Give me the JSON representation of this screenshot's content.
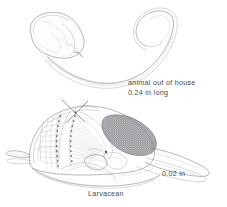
{
  "figure": {
    "title_label": "Larvacean",
    "background_color": "#ffffff",
    "ink_color": "#6f6f73",
    "text_color": "#4a4a4a",
    "width": 227,
    "height": 207
  },
  "annotations": {
    "animal_caption_line1": "animal out of house",
    "animal_caption_line2": "0.24 in long",
    "scale_label": "0.02 in"
  },
  "panels": {
    "upper": {
      "name": "animal out of house",
      "parts": [
        "trunk",
        "tail"
      ]
    },
    "lower": {
      "name": "larvacean house",
      "parts": [
        "house-envelope",
        "inlet-filter",
        "feeding-filter",
        "mesh-screen",
        "exit-chamber",
        "trunk-in-house",
        "tail-in-house"
      ]
    }
  }
}
